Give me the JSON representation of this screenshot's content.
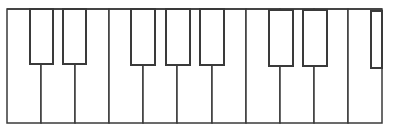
{
  "diagram": {
    "type": "piano-keyboard",
    "stroke_color": "#3a3a3a",
    "fill_color": "#ffffff",
    "frame": {
      "left": 7,
      "top": 9,
      "right": 382,
      "bottom": 123
    },
    "white_key_edges": [
      7,
      41,
      75,
      109,
      143,
      177,
      212,
      246,
      280,
      314,
      348,
      382
    ],
    "white_key_count": 11,
    "black_keys": [
      {
        "x1": 30,
        "x2": 53,
        "top": 9,
        "bottom": 64
      },
      {
        "x1": 63,
        "x2": 86,
        "top": 9,
        "bottom": 64
      },
      {
        "x1": 131,
        "x2": 155,
        "top": 9,
        "bottom": 65
      },
      {
        "x1": 166,
        "x2": 190,
        "top": 9,
        "bottom": 65
      },
      {
        "x1": 200,
        "x2": 224,
        "top": 9,
        "bottom": 65
      },
      {
        "x1": 269,
        "x2": 293,
        "top": 10,
        "bottom": 66
      },
      {
        "x1": 303,
        "x2": 327,
        "top": 10,
        "bottom": 66
      },
      {
        "x1": 371,
        "x2": 382,
        "top": 11,
        "bottom": 68,
        "partial": true
      }
    ]
  }
}
